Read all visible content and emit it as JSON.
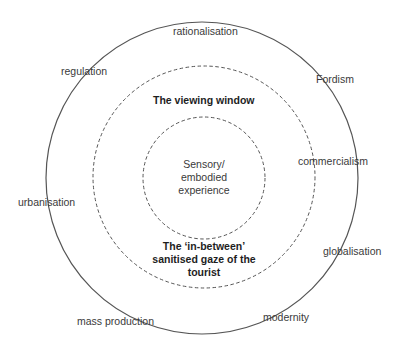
{
  "diagram": {
    "type": "concentric-circles",
    "rings": [
      {
        "name": "outer",
        "style": "solid",
        "center": [
          202,
          178
        ],
        "radius": 156,
        "stroke": "#555555"
      },
      {
        "name": "middle",
        "style": "dashed",
        "center": [
          204,
          177
        ],
        "radius": 111,
        "stroke": "#555555"
      },
      {
        "name": "inner",
        "style": "dashed",
        "center": [
          204,
          178
        ],
        "radius": 61,
        "stroke": "#555555"
      }
    ],
    "core": {
      "line1": "Sensory/",
      "line2": "embodied",
      "line3": "experience"
    },
    "middle_labels": {
      "top": "The viewing window",
      "bottom_line1": "The ‘in-between’",
      "bottom_line2": "sanitised gaze of the",
      "bottom_line3": "tourist"
    },
    "outer_labels": {
      "rationalisation": "rationalisation",
      "regulation": "regulation",
      "fordism": "Fordism",
      "commercialism": "commercialism",
      "urbanisation": "urbanisation",
      "globalisation": "globalisation",
      "mass_production": "mass production",
      "modernity": "modernity"
    }
  }
}
